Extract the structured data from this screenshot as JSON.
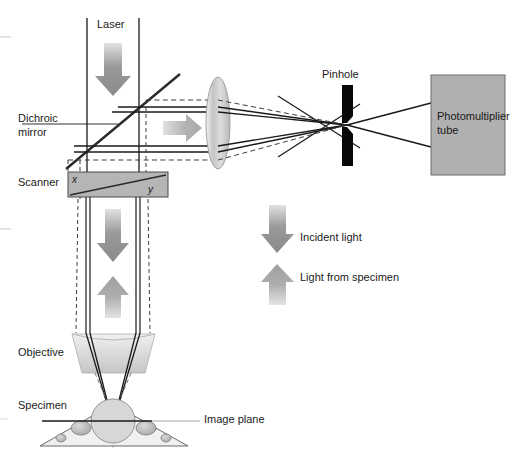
{
  "figure": {
    "background_color": "#ffffff"
  },
  "labels": {
    "laser": "Laser",
    "dichroic_line1": "Dichroic",
    "dichroic_line2": "mirror",
    "scanner": "Scanner",
    "scanner_axis_x": "x",
    "scanner_axis_y": "y",
    "pinhole": "Pinhole",
    "pmt_line1": "Photomultiplier",
    "pmt_line2": "tube",
    "objective": "Objective",
    "specimen": "Specimen",
    "image_plane": "Image plane"
  },
  "legend": {
    "items": [
      {
        "label": "Incident light",
        "direction": "down",
        "color": "#8c8c8c"
      },
      {
        "label": "Light from specimen",
        "direction": "up",
        "color": "#a6a6a6"
      }
    ]
  },
  "components": [
    {
      "name": "laser-source-beam-tube",
      "type": "tube",
      "x1": 87,
      "x2": 139,
      "y1": 18,
      "y2": 172
    },
    {
      "name": "dichroic-mirror",
      "type": "mirror",
      "from": [
        66,
        169
      ],
      "to": [
        180,
        74
      ]
    },
    {
      "name": "scanner-box",
      "type": "box",
      "x": 68,
      "y": 172,
      "width": 100,
      "height": 25,
      "fill": "#b5b5b5"
    },
    {
      "name": "tube-lens",
      "type": "ellipse",
      "cx": 218,
      "cy": 123,
      "rx": 12,
      "ry": 46
    },
    {
      "name": "pinhole-aperture",
      "type": "aperture",
      "cx": 347,
      "cy": 125,
      "width": 11,
      "height": 80
    },
    {
      "name": "photomultiplier-tube",
      "type": "box",
      "x": 431,
      "y": 75,
      "width": 74,
      "height": 100,
      "fill": "#b0b0b0"
    },
    {
      "name": "objective-lens",
      "type": "trapezoid",
      "cx": 113,
      "top_y": 333,
      "bottom_y": 373,
      "fill": "#d9d9d9"
    },
    {
      "name": "specimen-slide",
      "type": "triangle",
      "apex": [
        113,
        408
      ],
      "left": [
        40,
        446
      ],
      "right": [
        188,
        446
      ]
    },
    {
      "name": "image-plane-line",
      "type": "line",
      "x1": 42,
      "y1": 421,
      "x2": 196,
      "y2": 421
    }
  ],
  "colors": {
    "arrow_incident": "#8c8c8c",
    "arrow_from_specimen": "#a6a6a6",
    "beam_solid": "#1a1a1a",
    "beam_dashed": "#3d3d3d",
    "box_gray": "#b0b0b0",
    "lens_gray": "#cdcdcd",
    "text": "#1a1a1a"
  }
}
